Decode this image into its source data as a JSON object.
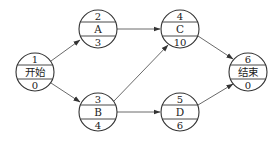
{
  "diagram": {
    "type": "activity-on-node network",
    "nodes": [
      {
        "id": "n1",
        "number": "1",
        "name": "开始",
        "duration": "0",
        "cx": 35,
        "cy": 72
      },
      {
        "id": "n2",
        "number": "2",
        "name": "A",
        "duration": "3",
        "cx": 98,
        "cy": 29
      },
      {
        "id": "n3",
        "number": "3",
        "name": "B",
        "duration": "4",
        "cx": 98,
        "cy": 112
      },
      {
        "id": "n4",
        "number": "4",
        "name": "C",
        "duration": "10",
        "cx": 180,
        "cy": 29
      },
      {
        "id": "n5",
        "number": "5",
        "name": "D",
        "duration": "6",
        "cx": 180,
        "cy": 112
      },
      {
        "id": "n6",
        "number": "6",
        "name": "结束",
        "duration": "0",
        "cx": 248,
        "cy": 72
      }
    ],
    "edges": [
      {
        "from": "1",
        "to": "2"
      },
      {
        "from": "1",
        "to": "3"
      },
      {
        "from": "2",
        "to": "4"
      },
      {
        "from": "3",
        "to": "4"
      },
      {
        "from": "3",
        "to": "5"
      },
      {
        "from": "4",
        "to": "6"
      },
      {
        "from": "5",
        "to": "6"
      }
    ]
  }
}
